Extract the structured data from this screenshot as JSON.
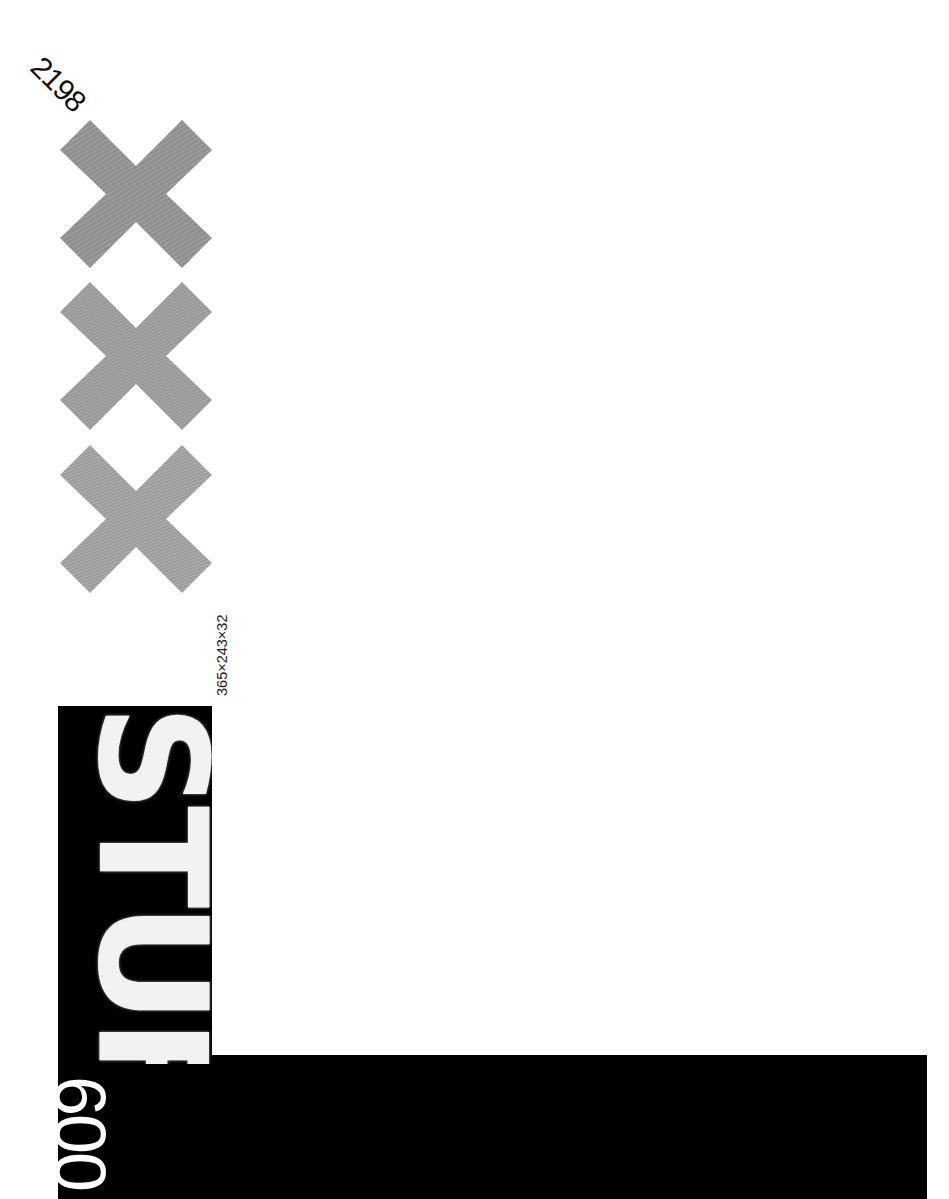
{
  "poster": {
    "code_number": "2198",
    "dimensions_label": "365×243×32",
    "title_word": "STUFF",
    "bottom_number": "600",
    "crosses": [
      {
        "name": "cross-1",
        "fill": "#8f8f8f"
      },
      {
        "name": "cross-2",
        "fill": "#9a9a9a"
      },
      {
        "name": "cross-3",
        "fill": "#a0a0a0"
      }
    ],
    "colors": {
      "background": "#ffffff",
      "blocks": "#000000",
      "cross": "#959595",
      "text_on_black": "#f2f2f2"
    }
  }
}
